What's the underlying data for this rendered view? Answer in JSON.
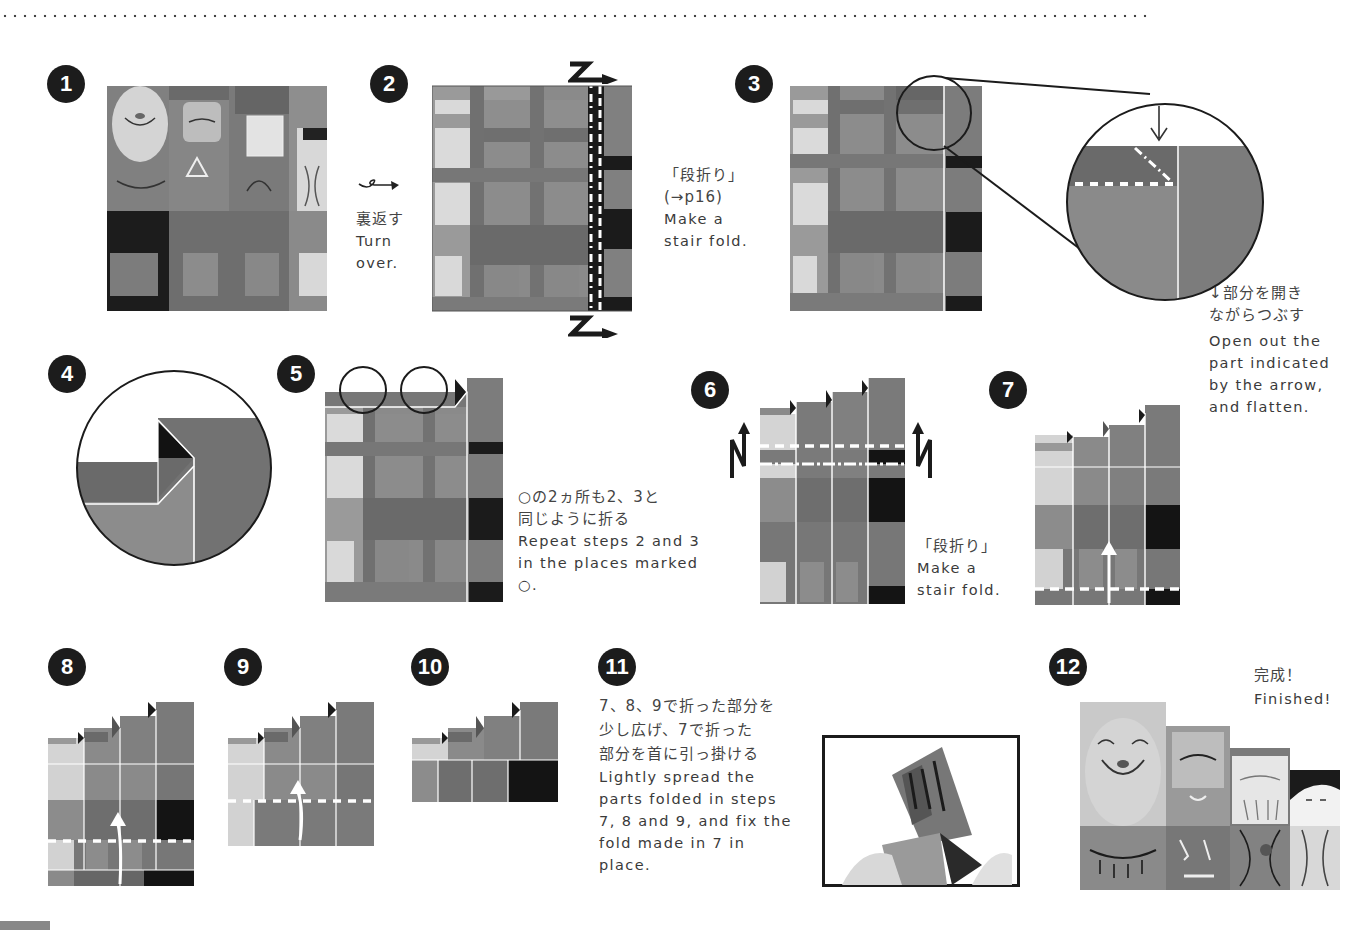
{
  "colors": {
    "badge": "#1c1c1c",
    "paper_light": "#d6d6d6",
    "paper_mid": "#8a8a8a",
    "paper_midlight": "#a4a4a4",
    "paper_dark": "#5c5c5c",
    "paper_black": "#1a1a1a",
    "fold_line": "#ffffff"
  },
  "steps": [
    {
      "number": "1",
      "text_jp": "",
      "text_en": ""
    },
    {
      "number": "2",
      "text_jp": "「段折り」",
      "text_ref": "(→p16)",
      "text_en_1": "Make a",
      "text_en_2": "stair fold."
    },
    {
      "number": "3",
      "text_jp_1": "↓部分を開き",
      "text_jp_2": "ながらつぶす",
      "text_en_1": "Open out the",
      "text_en_2": "part indicated",
      "text_en_3": "by the arrow,",
      "text_en_4": "and flatten."
    },
    {
      "number": "4"
    },
    {
      "number": "5",
      "text_jp_1": "○の2ヵ所も2、3と",
      "text_jp_2": "同じように折る",
      "text_en_1": "Repeat steps 2 and 3",
      "text_en_2": "in the places marked",
      "text_en_3": "○."
    },
    {
      "number": "6",
      "text_jp": "「段折り」",
      "text_en_1": "Make a",
      "text_en_2": "stair fold."
    },
    {
      "number": "7"
    },
    {
      "number": "8"
    },
    {
      "number": "9"
    },
    {
      "number": "10"
    },
    {
      "number": "11",
      "text_jp_1": "7、8、9で折った部分を",
      "text_jp_2": "少し広げ、7で折った",
      "text_jp_3": "部分を首に引っ掛ける",
      "text_en_1": "Lightly spread the",
      "text_en_2": "parts folded in steps",
      "text_en_3": "7, 8 and 9, and fix the",
      "text_en_4": "fold made in 7 in",
      "text_en_5": "place."
    },
    {
      "number": "12",
      "text_jp": "完成！",
      "text_en": "Finished!"
    }
  ],
  "turn_over": {
    "text_jp": "裏返す",
    "text_en_1": "Turn",
    "text_en_2": "over.",
    "icon": "turn-over-arrow-icon"
  }
}
